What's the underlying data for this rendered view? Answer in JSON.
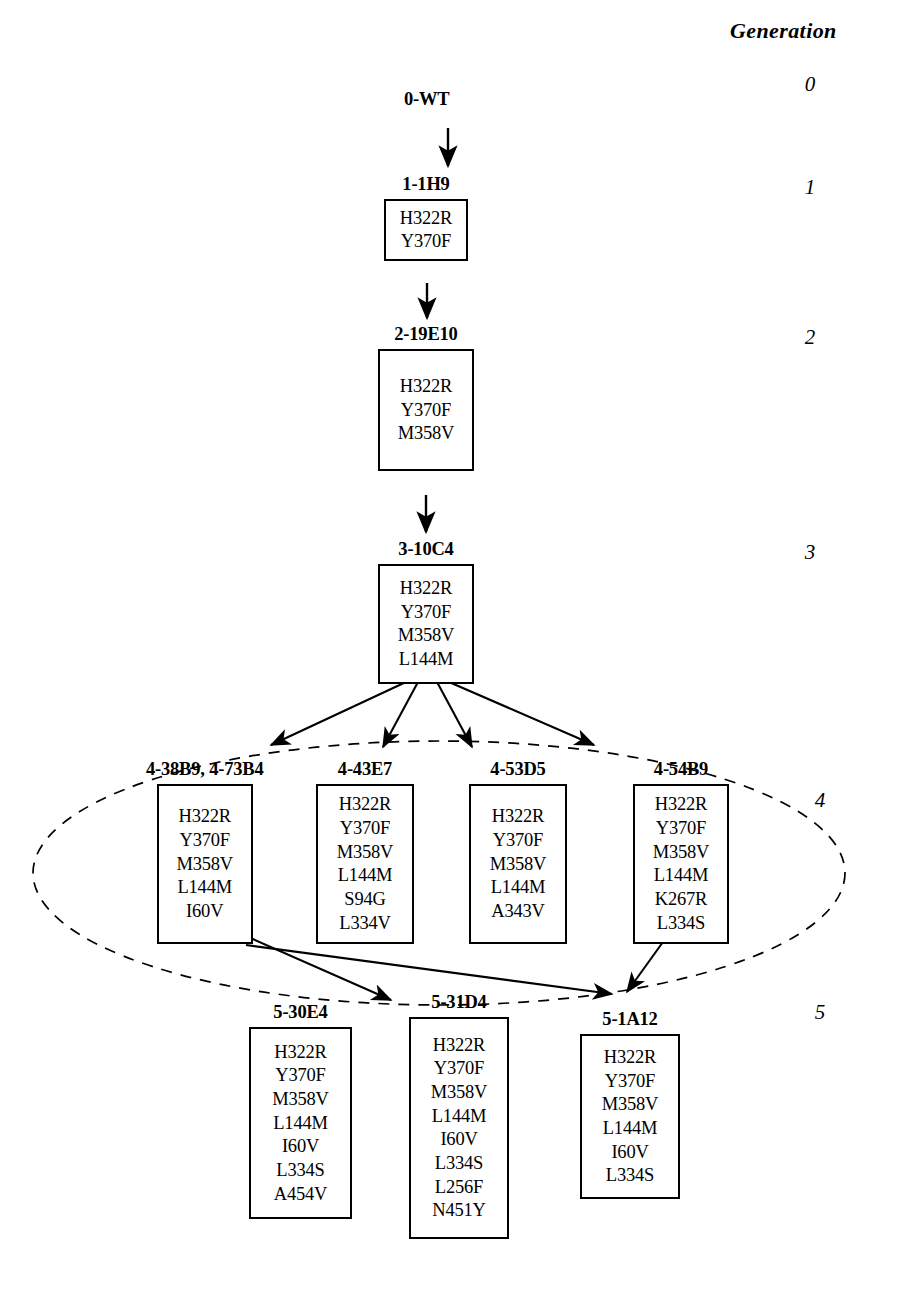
{
  "header": {
    "generation_label": "Generation"
  },
  "generation_numbers": [
    {
      "value": "0",
      "x": 795,
      "y": 72
    },
    {
      "value": "1",
      "x": 795,
      "y": 175
    },
    {
      "value": "2",
      "x": 795,
      "y": 325
    },
    {
      "value": "3",
      "x": 795,
      "y": 540
    },
    {
      "value": "4",
      "x": 805,
      "y": 788
    },
    {
      "value": "5",
      "x": 805,
      "y": 1000
    }
  ],
  "nodes": [
    {
      "id": "0-WT",
      "label": "0-WT",
      "mutations": [],
      "box": false,
      "x": 404,
      "y": 90,
      "box_width": 0,
      "box_height": 0
    },
    {
      "id": "1-1H9",
      "label": "1-1H9",
      "mutations": [
        "H322R",
        "Y370F"
      ],
      "box": true,
      "x": 384,
      "y": 175,
      "box_width": 84,
      "box_height": 62
    },
    {
      "id": "2-19E10",
      "label": "2-19E10",
      "mutations": [
        "H322R",
        "Y370F",
        "M358V"
      ],
      "box": true,
      "x": 378,
      "y": 325,
      "box_width": 96,
      "box_height": 122
    },
    {
      "id": "3-10C4",
      "label": "3-10C4",
      "mutations": [
        "H322R",
        "Y370F",
        "M358V",
        "L144M"
      ],
      "box": true,
      "x": 378,
      "y": 540,
      "box_width": 96,
      "box_height": 120
    },
    {
      "id": "4-38B9",
      "label": "4-38B9, 4-73B4",
      "mutations": [
        "H322R",
        "Y370F",
        "M358V",
        "L144M",
        "I60V"
      ],
      "box": true,
      "x": 146,
      "y": 760,
      "box_width": 96,
      "box_height": 160
    },
    {
      "id": "4-43E7",
      "label": "4-43E7",
      "mutations": [
        "H322R",
        "Y370F",
        "M358V",
        "L144M",
        "S94G",
        "L334V"
      ],
      "box": true,
      "x": 316,
      "y": 760,
      "box_width": 98,
      "box_height": 160
    },
    {
      "id": "4-53D5",
      "label": "4-53D5",
      "mutations": [
        "H322R",
        "Y370F",
        "M358V",
        "L144M",
        "A343V"
      ],
      "box": true,
      "x": 469,
      "y": 760,
      "box_width": 98,
      "box_height": 160
    },
    {
      "id": "4-54B9",
      "label": "4-54B9",
      "mutations": [
        "H322R",
        "Y370F",
        "M358V",
        "L144M",
        "K267R",
        "L334S"
      ],
      "box": true,
      "x": 633,
      "y": 760,
      "box_width": 96,
      "box_height": 160
    },
    {
      "id": "5-30E4",
      "label": "5-30E4",
      "mutations": [
        "H322R",
        "Y370F",
        "M358V",
        "L144M",
        "I60V",
        "L334S",
        "A454V"
      ],
      "box": true,
      "x": 249,
      "y": 1003,
      "box_width": 103,
      "box_height": 192
    },
    {
      "id": "5-31D4",
      "label": "5-31D4",
      "mutations": [
        "H322R",
        "Y370F",
        "M358V",
        "L144M",
        "I60V",
        "L334S",
        "L256F",
        "N451Y"
      ],
      "box": true,
      "x": 409,
      "y": 993,
      "box_width": 100,
      "box_height": 222
    },
    {
      "id": "5-1A12",
      "label": "5-1A12",
      "mutations": [
        "H322R",
        "Y370F",
        "M358V",
        "L144M",
        "I60V",
        "L334S"
      ],
      "box": true,
      "x": 580,
      "y": 1010,
      "box_width": 100,
      "box_height": 165
    }
  ],
  "edges": [
    {
      "from": "0-WT",
      "to": "1-1H9",
      "type": "arrow"
    },
    {
      "from": "1-1H9",
      "to": "2-19E10",
      "type": "arrow"
    },
    {
      "from": "2-19E10",
      "to": "3-10C4",
      "type": "arrow"
    },
    {
      "from": "3-10C4",
      "to": "4-38B9",
      "type": "arrow"
    },
    {
      "from": "3-10C4",
      "to": "4-43E7",
      "type": "arrow"
    },
    {
      "from": "3-10C4",
      "to": "4-53D5",
      "type": "arrow"
    },
    {
      "from": "3-10C4",
      "to": "4-54B9",
      "type": "arrow"
    },
    {
      "from": "4-38B9",
      "to": "5-31D4",
      "type": "arrow"
    },
    {
      "from": "4-38B9",
      "to": "5-1A12",
      "type": "arrow"
    },
    {
      "from": "4-54B9",
      "to": "5-1A12",
      "type": "arrow"
    }
  ],
  "grouping_ellipse": {
    "name": "generation-4-grouping-ellipse",
    "style": "dashed",
    "cx": 439,
    "cy": 873,
    "rx": 406,
    "ry": 132
  },
  "colors": {
    "ink": "#000000",
    "background": "#ffffff"
  }
}
